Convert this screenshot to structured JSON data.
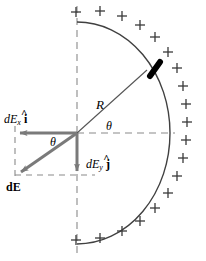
{
  "figure": {
    "type": "physics-vector-diagram",
    "width": 206,
    "height": 261,
    "background_color": "#ffffff"
  },
  "labels": {
    "radius": "R",
    "theta_center": "θ",
    "theta_lower": "θ",
    "dEx": {
      "d": "d",
      "E": "E",
      "sub": "x",
      "unit": "i",
      "hat": "^"
    },
    "dEy": {
      "d": "d",
      "E": "E",
      "sub": "y",
      "unit": "j",
      "hat": "^"
    },
    "dE": "dE",
    "charge_sign": "+"
  },
  "geometry": {
    "center": {
      "x": 77,
      "y": 133
    },
    "radius_x": 93,
    "radius_y": 111,
    "arc_span_degrees": 180,
    "arc_orientation": "opens-left",
    "charge_element_angle_degrees": 42,
    "radius_line_angle_degrees": 42,
    "dEx_arrow_end": {
      "x": 16,
      "y": 133
    },
    "dEy_arrow_end": {
      "x": 77,
      "y": 175
    },
    "dE_arrow_end": {
      "x": 16,
      "y": 175
    },
    "plus_count": 26
  },
  "colors": {
    "stroke": "#3a3a3a",
    "arc": "#404040",
    "vector": "#7a7a7a",
    "dashed": "#8a8a8a",
    "charge_element": "#000000",
    "text": "#000000"
  },
  "charges": [
    {
      "x": 76,
      "y": 12
    },
    {
      "x": 100,
      "y": 11
    },
    {
      "x": 122,
      "y": 16
    },
    {
      "x": 140,
      "y": 25
    },
    {
      "x": 155,
      "y": 37
    },
    {
      "x": 168,
      "y": 52
    },
    {
      "x": 177,
      "y": 68
    },
    {
      "x": 183,
      "y": 86
    },
    {
      "x": 186,
      "y": 104
    },
    {
      "x": 187,
      "y": 122
    },
    {
      "x": 186,
      "y": 140
    },
    {
      "x": 183,
      "y": 158
    },
    {
      "x": 177,
      "y": 176
    },
    {
      "x": 168,
      "y": 193
    },
    {
      "x": 155,
      "y": 208
    },
    {
      "x": 140,
      "y": 221
    },
    {
      "x": 122,
      "y": 231
    },
    {
      "x": 100,
      "y": 238
    },
    {
      "x": 76,
      "y": 240
    }
  ]
}
